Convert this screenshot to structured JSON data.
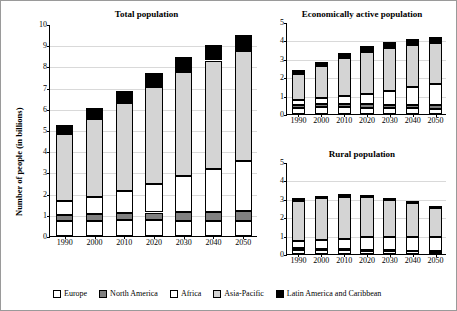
{
  "axis_label_y": "Number of people (in billions)",
  "legend": {
    "items": [
      {
        "label": "Europe",
        "color": "#ffffff"
      },
      {
        "label": "North America",
        "color": "#808080"
      },
      {
        "label": "Africa",
        "color": "#ffffff"
      },
      {
        "label": "Asia-Pacific",
        "color": "#d4d4d4"
      },
      {
        "label": "Latin America and Caribbean",
        "color": "#000000"
      }
    ]
  },
  "chart_data": [
    {
      "type": "bar",
      "stacked": true,
      "title": "Total population",
      "xlabel": "",
      "ylabel": "Number of people (in billions)",
      "categories": [
        "1990",
        "2000",
        "2010",
        "2020",
        "2030",
        "2040",
        "2050"
      ],
      "ylim": [
        0,
        10
      ],
      "yticks": [
        0,
        1,
        2,
        3,
        4,
        5,
        6,
        7,
        8,
        9,
        10
      ],
      "grid": true,
      "series": [
        {
          "name": "Europe",
          "color": "#ffffff",
          "values": [
            0.72,
            0.73,
            0.74,
            0.74,
            0.73,
            0.71,
            0.71
          ]
        },
        {
          "name": "North America",
          "color": "#808080",
          "values": [
            0.28,
            0.31,
            0.34,
            0.37,
            0.4,
            0.43,
            0.45
          ]
        },
        {
          "name": "Africa",
          "color": "#ffffff",
          "values": [
            0.63,
            0.81,
            1.03,
            1.34,
            1.68,
            2.03,
            2.39
          ]
        },
        {
          "name": "Asia-Pacific",
          "color": "#d4d4d4",
          "values": [
            3.17,
            3.68,
            4.16,
            4.6,
            4.93,
            5.11,
            5.16
          ]
        },
        {
          "name": "Latin America and Caribbean",
          "color": "#000000",
          "values": [
            0.44,
            0.52,
            0.59,
            0.66,
            0.72,
            0.75,
            0.78
          ]
        }
      ]
    },
    {
      "type": "bar",
      "stacked": true,
      "title": "Economically active population",
      "xlabel": "",
      "ylabel": "",
      "categories": [
        "1990",
        "2000",
        "2010",
        "2020",
        "2030",
        "2040",
        "2050"
      ],
      "ylim": [
        0,
        5
      ],
      "yticks": [
        0,
        1,
        2,
        3,
        4,
        5
      ],
      "grid": true,
      "series": [
        {
          "name": "Europe",
          "color": "#ffffff",
          "values": [
            0.35,
            0.36,
            0.36,
            0.34,
            0.32,
            0.3,
            0.29
          ]
        },
        {
          "name": "North America",
          "color": "#808080",
          "values": [
            0.14,
            0.16,
            0.17,
            0.18,
            0.19,
            0.2,
            0.21
          ]
        },
        {
          "name": "Africa",
          "color": "#ffffff",
          "values": [
            0.25,
            0.33,
            0.44,
            0.59,
            0.76,
            0.95,
            1.14
          ]
        },
        {
          "name": "Asia-Pacific",
          "color": "#d4d4d4",
          "values": [
            1.44,
            1.75,
            2.05,
            2.24,
            2.31,
            2.29,
            2.21
          ]
        },
        {
          "name": "Latin America and Caribbean",
          "color": "#000000",
          "values": [
            0.19,
            0.24,
            0.29,
            0.33,
            0.35,
            0.36,
            0.36
          ]
        }
      ]
    },
    {
      "type": "bar",
      "stacked": true,
      "title": "Rural population",
      "xlabel": "",
      "ylabel": "",
      "categories": [
        "1990",
        "2000",
        "2010",
        "2020",
        "2030",
        "2040",
        "2050"
      ],
      "ylim": [
        0,
        5
      ],
      "yticks": [
        0,
        1,
        2,
        3,
        4,
        5
      ],
      "grid": true,
      "series": [
        {
          "name": "Europe",
          "color": "#ffffff",
          "values": [
            0.23,
            0.21,
            0.2,
            0.18,
            0.16,
            0.14,
            0.12
          ]
        },
        {
          "name": "North America",
          "color": "#808080",
          "values": [
            0.07,
            0.06,
            0.06,
            0.06,
            0.05,
            0.05,
            0.05
          ]
        },
        {
          "name": "Africa",
          "color": "#ffffff",
          "values": [
            0.4,
            0.48,
            0.58,
            0.66,
            0.72,
            0.74,
            0.73
          ]
        },
        {
          "name": "Asia-Pacific",
          "color": "#d4d4d4",
          "values": [
            2.19,
            2.28,
            2.28,
            2.2,
            2.03,
            1.82,
            1.59
          ]
        },
        {
          "name": "Latin America and Caribbean",
          "color": "#000000",
          "values": [
            0.13,
            0.13,
            0.12,
            0.12,
            0.11,
            0.11,
            0.1
          ]
        }
      ]
    }
  ]
}
